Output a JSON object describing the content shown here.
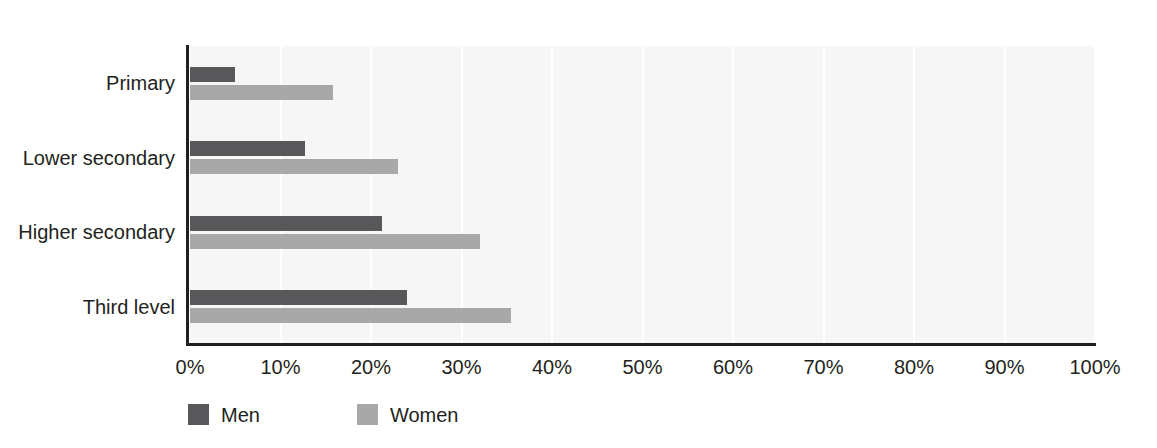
{
  "chart_data": {
    "type": "bar",
    "orientation": "horizontal",
    "title": "",
    "subtitle": "",
    "xlabel": "",
    "ylabel": "",
    "xlim": [
      0,
      100
    ],
    "xtick_labels": [
      "0%",
      "10%",
      "20%",
      "30%",
      "40%",
      "50%",
      "60%",
      "70%",
      "80%",
      "90%",
      "100%"
    ],
    "xtick_values": [
      0,
      10,
      20,
      30,
      40,
      50,
      60,
      70,
      80,
      90,
      100
    ],
    "grid": true,
    "grid_axis": "x",
    "legend_position": "bottom-left",
    "categories": [
      "Primary",
      "Lower secondary",
      "Higher secondary",
      "Third level"
    ],
    "series": [
      {
        "name": "Men",
        "color": "#58585a",
        "values": [
          5.0,
          12.7,
          21.2,
          24.0
        ]
      },
      {
        "name": "Women",
        "color": "#a8a8a8",
        "values": [
          15.8,
          23.0,
          32.0,
          35.5
        ]
      }
    ]
  },
  "colors": {
    "men": "#58585a",
    "women": "#a8a8a8",
    "plot_background": "#f6f6f6",
    "gridline": "#ffffff",
    "axis": "#231f20",
    "text": "#231f20",
    "page_background": "#ffffff"
  }
}
